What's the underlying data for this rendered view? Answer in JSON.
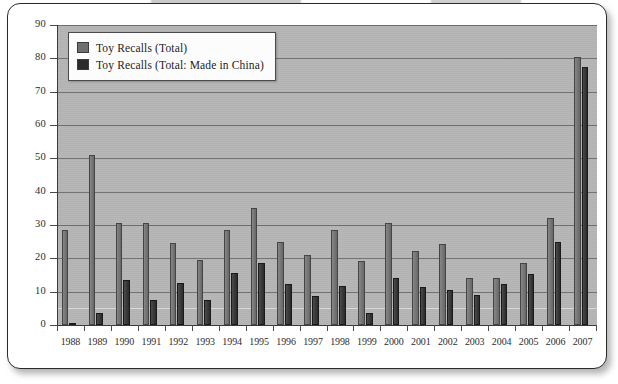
{
  "chart_data": {
    "type": "bar",
    "title": "",
    "subtitle": "",
    "xlabel": "",
    "ylabel": "",
    "ylim": [
      0,
      90
    ],
    "ytick_step": 10,
    "yticks": [
      0,
      10,
      20,
      30,
      40,
      50,
      60,
      70,
      80,
      90
    ],
    "grid": true,
    "grid_axis": "y",
    "legend_position": "top-left-inside",
    "categories": [
      "1988",
      "1989",
      "1990",
      "1991",
      "1992",
      "1993",
      "1994",
      "1995",
      "1996",
      "1997",
      "1998",
      "1999",
      "2000",
      "2001",
      "2002",
      "2003",
      "2004",
      "2005",
      "2006",
      "2007"
    ],
    "series": [
      {
        "name": "Toy Recalls (Total)",
        "color": "#6f6f6f",
        "values": [
          28.5,
          51,
          30.5,
          30.5,
          24.5,
          19.5,
          28.5,
          35,
          25,
          21,
          28.5,
          19.3,
          30.5,
          22.3,
          24.3,
          14,
          14,
          18.5,
          32,
          80.5
        ]
      },
      {
        "name": "Toy Recalls (Total: Made in China)",
        "color": "#2b2b2b",
        "values": [
          0.5,
          3.5,
          13.5,
          7.5,
          12.5,
          7.5,
          15.5,
          18.7,
          12.3,
          8.7,
          11.7,
          3.5,
          14,
          11.5,
          10.5,
          9,
          12.2,
          15.3,
          25,
          77.3
        ]
      }
    ]
  },
  "legend": {
    "items": [
      {
        "label": "Toy Recalls (Total)",
        "swatch": "total"
      },
      {
        "label": "Toy Recalls (Total: Made in China)",
        "swatch": "china"
      }
    ]
  },
  "colors": {
    "plot_background": "#b4b4b4",
    "gridline": "#6d6d6d",
    "axis": "#3a3a3a",
    "series_total": "#6f6f6f",
    "series_china": "#2b2b2b",
    "page_background": "#ffffff",
    "text": "#2d2d2d"
  }
}
